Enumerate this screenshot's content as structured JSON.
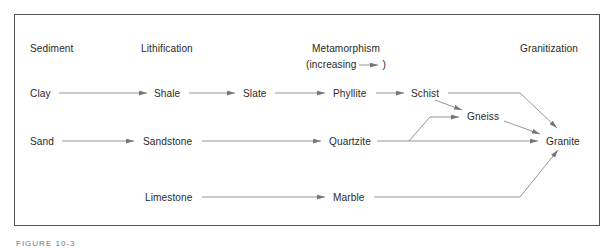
{
  "diagram": {
    "headers": {
      "sediment": "Sediment",
      "lithification": "Lithification",
      "metamorphism": "Metamorphism",
      "metamorphism_sub": "(increasing",
      "metamorphism_sub_close": ")",
      "granitization": "Granitization"
    },
    "nodes": {
      "clay": "Clay",
      "shale": "Shale",
      "slate": "Slate",
      "phyllite": "Phyllite",
      "schist": "Schist",
      "gneiss": "Gneiss",
      "sand": "Sand",
      "sandstone": "Sandstone",
      "quartzite": "Quartzite",
      "granite": "Granite",
      "limestone": "Limestone",
      "marble": "Marble"
    },
    "edges": [
      [
        "Clay",
        "Shale"
      ],
      [
        "Shale",
        "Slate"
      ],
      [
        "Slate",
        "Phyllite"
      ],
      [
        "Phyllite",
        "Schist"
      ],
      [
        "Schist",
        "Gneiss"
      ],
      [
        "Schist",
        "Granite"
      ],
      [
        "Gneiss",
        "Granite"
      ],
      [
        "Sand",
        "Sandstone"
      ],
      [
        "Sandstone",
        "Quartzite"
      ],
      [
        "Quartzite",
        "Gneiss"
      ],
      [
        "Quartzite",
        "Granite"
      ],
      [
        "Limestone",
        "Marble"
      ],
      [
        "Marble",
        "Granite"
      ]
    ],
    "caption": "FIGURE 10-3"
  }
}
